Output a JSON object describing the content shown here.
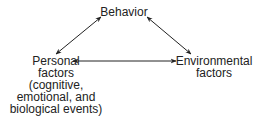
{
  "diagram": {
    "nodes": {
      "behavior": {
        "lines": [
          "Behavior"
        ]
      },
      "personal": {
        "lines": [
          "Personal",
          "factors",
          "(cognitive,",
          "emotional, and",
          "biological events)"
        ]
      },
      "environmental": {
        "lines": [
          "Environmental",
          "factors"
        ]
      }
    },
    "edges": [
      {
        "from": "behavior",
        "to": "personal",
        "bidirectional": true
      },
      {
        "from": "behavior",
        "to": "environmental",
        "bidirectional": true
      },
      {
        "from": "personal",
        "to": "environmental",
        "bidirectional": true
      }
    ],
    "colors": {
      "line": "#222222",
      "text": "#222222"
    }
  }
}
